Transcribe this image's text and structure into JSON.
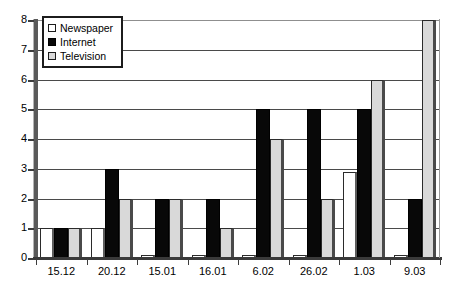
{
  "chart_data": {
    "type": "bar",
    "title": "",
    "subtitle": "",
    "xlabel": "",
    "ylabel": "",
    "ylim": [
      0,
      8
    ],
    "y_ticks": [
      0,
      1,
      2,
      3,
      4,
      5,
      6,
      7,
      8
    ],
    "grid": true,
    "legend_position": "top-left",
    "categories": [
      "15.12",
      "20.12",
      "15.01",
      "16.01",
      "6.02",
      "26.02",
      "1.03",
      "9.03"
    ],
    "series": [
      {
        "name": "Newspaper",
        "color": "#ffffff",
        "values": [
          1,
          1,
          0,
          0,
          0,
          0,
          2.9,
          0
        ]
      },
      {
        "name": "Internet",
        "color": "#080808",
        "values": [
          1,
          3,
          2,
          2,
          5,
          5,
          5,
          2
        ]
      },
      {
        "name": "Television",
        "color": "#d9d9d9",
        "values": [
          1,
          2,
          2,
          1,
          4,
          2,
          6,
          8
        ]
      }
    ]
  },
  "legend": {
    "items": [
      {
        "label": "Newspaper",
        "swatch": "legend-swatch-newspaper"
      },
      {
        "label": "Internet",
        "swatch": "legend-swatch-internet"
      },
      {
        "label": "Television",
        "swatch": "legend-swatch-television"
      }
    ]
  },
  "axes": {
    "y_tick_labels": [
      "8",
      "7",
      "6",
      "5",
      "4",
      "3",
      "2",
      "1",
      "0"
    ],
    "x_tick_labels": [
      "15.12",
      "20.12",
      "15.01",
      "16.01",
      "6.02",
      "26.02",
      "1.03",
      "9.03"
    ]
  }
}
